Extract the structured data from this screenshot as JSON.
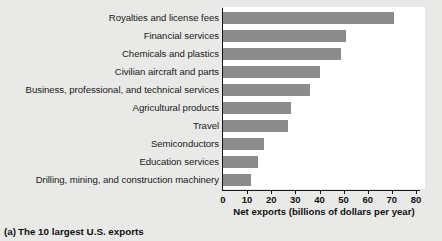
{
  "figure": {
    "caption_letter": "(a)",
    "caption_text": "The 10 largest U.S. exports",
    "bar_color": "#8c8c8c",
    "panel_color": "#ffffff",
    "page_color": "#e9e9e7",
    "axis_color": "#171717"
  },
  "chart_data": {
    "type": "bar",
    "orientation": "horizontal",
    "title": "",
    "subtitle": "",
    "xlabel": "Net exports (billions of dollars per year)",
    "ylabel": "",
    "xlim": [
      0,
      80
    ],
    "xticks": [
      0,
      10,
      20,
      30,
      40,
      50,
      60,
      70,
      80
    ],
    "xticklabels": [
      "0",
      "10",
      "20",
      "30",
      "40",
      "50",
      "60",
      "70",
      "80"
    ],
    "grid": false,
    "legend": null,
    "categories": [
      "Royalties and license fees",
      "Financial services",
      "Chemicals and plastics",
      "Civilian aircraft and parts",
      "Business, professional, and technical services",
      "Agricultural products",
      "Travel",
      "Semiconductors",
      "Education services",
      "Drilling, mining, and construction machinery"
    ],
    "values": [
      71,
      51,
      49,
      40,
      36,
      28,
      27,
      17,
      14.5,
      11.5
    ],
    "units": "billions of dollars per year"
  }
}
